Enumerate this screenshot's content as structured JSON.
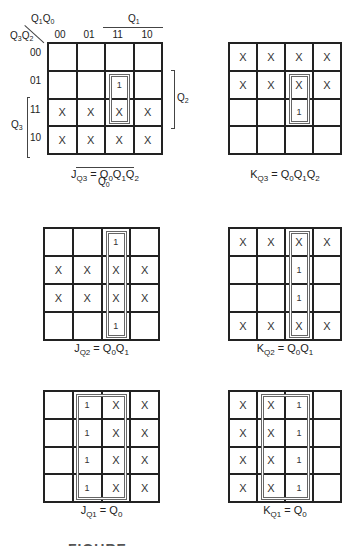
{
  "figure": {
    "axis_labels": {
      "corner_cols": "Q1Q0",
      "corner_rows": "Q3Q2",
      "col_codes": [
        "00",
        "01",
        "11",
        "10"
      ],
      "row_codes": [
        "00",
        "01",
        "11",
        "10"
      ],
      "q1_span": "Q1",
      "q2_span": "Q2",
      "q3_span": "Q3",
      "q0_span": "Q0"
    },
    "maps": [
      {
        "id": "jq3",
        "equation": {
          "lhs": "J",
          "lhs_sub": "Q3",
          "rhs": "Q0Q1Q2"
        },
        "cells": [
          [
            "",
            "",
            "",
            ""
          ],
          [
            "",
            "",
            "1",
            ""
          ],
          [
            "X",
            "X",
            "X",
            "X"
          ],
          [
            "X",
            "X",
            "X",
            "X"
          ]
        ],
        "group": {
          "col": 2,
          "row_start": 1,
          "row_end": 2
        }
      },
      {
        "id": "kq3",
        "equation": {
          "lhs": "K",
          "lhs_sub": "Q3",
          "rhs": "Q0Q1Q2"
        },
        "cells": [
          [
            "X",
            "X",
            "X",
            "X"
          ],
          [
            "X",
            "X",
            "X",
            "X"
          ],
          [
            "",
            "",
            "1",
            ""
          ],
          [
            "",
            "",
            "",
            ""
          ]
        ],
        "group": {
          "col": 2,
          "row_start": 1,
          "row_end": 2
        }
      },
      {
        "id": "jq2",
        "equation": {
          "lhs": "J",
          "lhs_sub": "Q2",
          "rhs": "Q0Q1"
        },
        "cells": [
          [
            "",
            "",
            "1",
            ""
          ],
          [
            "X",
            "X",
            "X",
            "X"
          ],
          [
            "X",
            "X",
            "X",
            "X"
          ],
          [
            "",
            "",
            "1",
            ""
          ]
        ],
        "group": {
          "col": 2,
          "row_start": 0,
          "row_end": 3
        }
      },
      {
        "id": "kq2",
        "equation": {
          "lhs": "K",
          "lhs_sub": "Q2",
          "rhs": "Q0Q1"
        },
        "cells": [
          [
            "X",
            "X",
            "X",
            "X"
          ],
          [
            "",
            "",
            "1",
            ""
          ],
          [
            "",
            "",
            "1",
            ""
          ],
          [
            "X",
            "X",
            "X",
            "X"
          ]
        ],
        "group": {
          "col": 2,
          "row_start": 0,
          "row_end": 3
        }
      },
      {
        "id": "jq1",
        "equation": {
          "lhs": "J",
          "lhs_sub": "Q1",
          "rhs": "Q0"
        },
        "cells": [
          [
            "",
            "1",
            "X",
            "X"
          ],
          [
            "",
            "1",
            "X",
            "X"
          ],
          [
            "",
            "1",
            "X",
            "X"
          ],
          [
            "",
            "1",
            "X",
            "X"
          ]
        ],
        "group": {
          "col_start": 1,
          "col_end": 2,
          "row_start": 0,
          "row_end": 3
        }
      },
      {
        "id": "kq1",
        "equation": {
          "lhs": "K",
          "lhs_sub": "Q1",
          "rhs": "Q0"
        },
        "cells": [
          [
            "X",
            "X",
            "1",
            ""
          ],
          [
            "X",
            "X",
            "1",
            ""
          ],
          [
            "X",
            "X",
            "1",
            ""
          ],
          [
            "X",
            "X",
            "1",
            ""
          ]
        ],
        "group": {
          "col_start": 1,
          "col_end": 2,
          "row_start": 0,
          "row_end": 3
        }
      }
    ],
    "caption_partial": "FIGURE"
  }
}
